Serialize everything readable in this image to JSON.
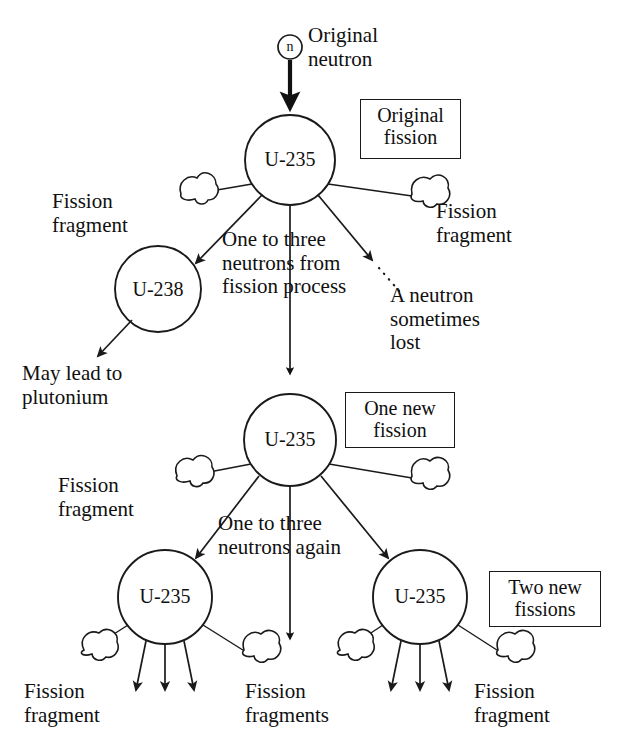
{
  "diagram": {
    "ink_color": "#1a1a1a",
    "background": "#ffffff",
    "nuclei": [
      {
        "id": "u235-gen0",
        "label": "U-235",
        "cx": 290,
        "cy": 160,
        "r": 45
      },
      {
        "id": "u238",
        "label": "U-238",
        "cx": 158,
        "cy": 289,
        "r": 43
      },
      {
        "id": "u235-gen1",
        "label": "U-235",
        "cx": 290,
        "cy": 440,
        "r": 46
      },
      {
        "id": "u235-gen2-left",
        "label": "U-235",
        "cx": 165,
        "cy": 597,
        "r": 47
      },
      {
        "id": "u235-gen2-right",
        "label": "U-235",
        "cx": 420,
        "cy": 597,
        "r": 47
      }
    ],
    "neutron_marker": {
      "label": "n",
      "cx": 290,
      "cy": 47,
      "r": 12
    },
    "boxed_labels": [
      {
        "id": "original-fission",
        "text": "Original\nfission",
        "x": 360,
        "y": 99,
        "w": 101,
        "h": 60
      },
      {
        "id": "one-new-fission",
        "text": "One new\nfission",
        "x": 345,
        "y": 392,
        "w": 110,
        "h": 56
      },
      {
        "id": "two-new-fissions",
        "text": "Two new\nfissions",
        "x": 489,
        "y": 571,
        "w": 112,
        "h": 56
      }
    ],
    "labels": [
      {
        "id": "original-neutron",
        "text": "Original\nneutron",
        "x": 308,
        "y": 24,
        "w": 140,
        "size": 21,
        "align": "left"
      },
      {
        "id": "fission-fragment-top-left",
        "text": "Fission\nfragment",
        "x": 52,
        "y": 190,
        "w": 120,
        "size": 21,
        "align": "left"
      },
      {
        "id": "fission-fragment-top-right",
        "text": "Fission\nfragment",
        "x": 436,
        "y": 200,
        "w": 130,
        "size": 21,
        "align": "left"
      },
      {
        "id": "one-to-three-neutrons",
        "text": "One to three\nneutrons from\nfission process",
        "x": 222,
        "y": 228,
        "w": 190,
        "size": 21,
        "align": "left"
      },
      {
        "id": "neutron-lost",
        "text": "A neutron\nsometimes\nlost",
        "x": 390,
        "y": 284,
        "w": 120,
        "size": 21,
        "align": "left"
      },
      {
        "id": "may-lead-to-plutonium",
        "text": "May lead to\nplutonium",
        "x": 22,
        "y": 362,
        "w": 170,
        "size": 21,
        "align": "left"
      },
      {
        "id": "fission-fragment-mid-left",
        "text": "Fission\nfragment",
        "x": 58,
        "y": 474,
        "w": 120,
        "size": 21,
        "align": "left"
      },
      {
        "id": "one-to-three-neutrons-again",
        "text": "One to three\nneutrons again",
        "x": 218,
        "y": 512,
        "w": 190,
        "size": 21,
        "align": "left"
      },
      {
        "id": "fission-fragment-bottom-left",
        "text": "Fission\nfragment",
        "x": 24,
        "y": 680,
        "w": 120,
        "size": 21,
        "align": "left"
      },
      {
        "id": "fission-fragments-bottom-center",
        "text": "Fission\nfragments",
        "x": 245,
        "y": 680,
        "w": 140,
        "size": 21,
        "align": "left"
      },
      {
        "id": "fission-fragment-bottom-right",
        "text": "Fission\nfragment",
        "x": 474,
        "y": 680,
        "w": 130,
        "size": 21,
        "align": "left"
      }
    ],
    "chain_steps": [
      "Original neutron strikes U-235",
      "Original fission releases one to three neutrons from fission process",
      "A neutron may be captured by U-238, which may lead to plutonium",
      "A neutron is sometimes lost",
      "One new fission of U-235 releases one to three neutrons again",
      "Two new fissions of U-235 produce fission fragments"
    ]
  }
}
